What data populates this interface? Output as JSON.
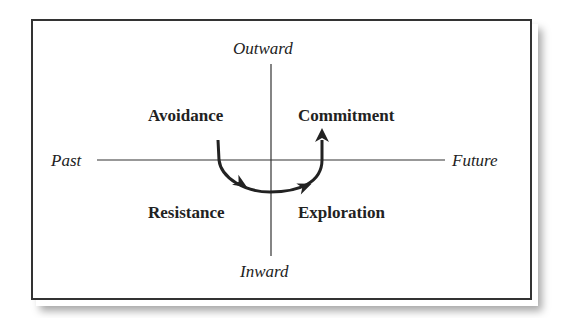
{
  "axes": {
    "top": "Outward",
    "bottom": "Inward",
    "left": "Past",
    "right": "Future"
  },
  "quadrants": {
    "top_left": "Avoidance",
    "top_right": "Commitment",
    "bottom_left": "Resistance",
    "bottom_right": "Exploration"
  },
  "flow": {
    "path": [
      "Avoidance",
      "Resistance",
      "Exploration",
      "Commitment"
    ],
    "description": "Curved arrow from Avoidance down through Resistance and Exploration, then up to Commitment"
  },
  "colors": {
    "frame": "#333333",
    "lines": "#333333",
    "arrow": "#222222",
    "text": "#222222",
    "background": "#ffffff"
  }
}
